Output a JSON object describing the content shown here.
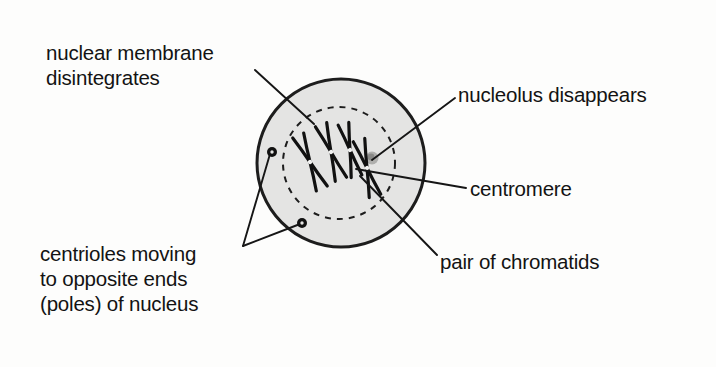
{
  "figure": {
    "background_color": "#fdfdfc",
    "ink_color": "#131313"
  },
  "cell": {
    "name": "cell",
    "fill_color": "#e4e4e3",
    "outline_color": "#1d1d1d",
    "center_x": 341,
    "center_y": 163,
    "radius": 84,
    "outline_width": 3
  },
  "nuclear_envelope": {
    "name": "nuclear membrane (dashed, disintegrating)",
    "center_x": 339,
    "center_y": 163,
    "radius": 56,
    "stroke_color": "#1d1d1d",
    "dash": "6 6",
    "stroke_width": 2
  },
  "nucleolus": {
    "name": "nucleolus",
    "x": 372,
    "y": 158,
    "radius": 6,
    "color": "#9a9a98"
  },
  "chromosomes": [
    {
      "cx": 310,
      "cy": 162,
      "angle": -24,
      "length": 58,
      "spread": 7
    },
    {
      "cx": 331,
      "cy": 152,
      "angle": -20,
      "length": 58,
      "spread": 7
    },
    {
      "cx": 350,
      "cy": 150,
      "angle": -14,
      "length": 54,
      "spread": 7
    },
    {
      "cx": 367,
      "cy": 168,
      "angle": -16,
      "length": 58,
      "spread": 7
    }
  ],
  "centrioles": [
    {
      "name": "centriole-upper-left",
      "x": 272,
      "y": 152,
      "radius": 5
    },
    {
      "name": "centriole-lower",
      "x": 302,
      "y": 223,
      "radius": 5
    }
  ],
  "leader_lines": {
    "nuclear_membrane": {
      "x1": 255,
      "y1": 70,
      "x2": 314,
      "y2": 124
    },
    "nucleolus": {
      "x1": 455,
      "y1": 98,
      "x2": 372,
      "y2": 160
    },
    "centromere": {
      "x1": 466,
      "y1": 188,
      "x2": 356,
      "y2": 169
    },
    "pair_of_chromatids": {
      "x1": 437,
      "y1": 255,
      "x2": 360,
      "y2": 176
    },
    "centrioles_vertex": {
      "x": 243,
      "y": 246
    },
    "centrioles_to_upper": {
      "x1": 243,
      "y1": 246,
      "x2": 270,
      "y2": 154
    },
    "centrioles_to_lower": {
      "x1": 243,
      "y1": 246,
      "x2": 300,
      "y2": 224
    }
  },
  "labels": {
    "nuclear_membrane": "nuclear membrane\ndisintegrates",
    "nucleolus": "nucleolus disappears",
    "centromere": "centromere",
    "pair_of_chromatids": "pair of chromatids",
    "centrioles": "centrioles moving\nto opposite ends\n(poles) of nucleus"
  }
}
